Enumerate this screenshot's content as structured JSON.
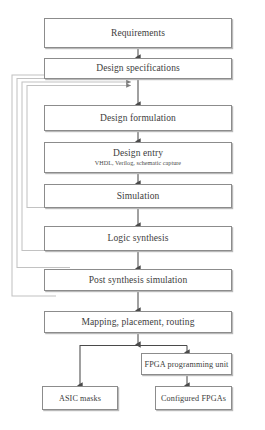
{
  "diagram": {
    "stroke_color": "#8c8c8c",
    "shadow_color": "#b9b9b9",
    "loop_color": "#c2c2c2",
    "text_color": "#3d3d3d",
    "background": "#ffffff"
  },
  "nodes": {
    "requirements": {
      "label": "Requirements"
    },
    "design_specifications": {
      "label": "Design specifications"
    },
    "design_formulation": {
      "label": "Design formulation"
    },
    "design_entry": {
      "label": "Design entry",
      "subtitle": "VHDL, Verilog, schematic capture"
    },
    "simulation": {
      "label": "Simulation"
    },
    "logic_synthesis": {
      "label": "Logic synthesis"
    },
    "post_synthesis_simulation": {
      "label": "Post synthesis simulation"
    },
    "mapping_placement_routing": {
      "label": "Mapping, placement, routing"
    },
    "fpga_programming_unit": {
      "label": "FPGA programming unit"
    },
    "asic_masks": {
      "label": "ASIC masks"
    },
    "configured_fpgas": {
      "label": "Configured FPGAs"
    }
  },
  "edges": [
    {
      "from": "requirements",
      "to": "design_specifications",
      "kind": "forward"
    },
    {
      "from": "design_specifications",
      "to": "design_formulation",
      "kind": "forward"
    },
    {
      "from": "design_formulation",
      "to": "design_entry",
      "kind": "forward"
    },
    {
      "from": "design_entry",
      "to": "simulation",
      "kind": "forward"
    },
    {
      "from": "simulation",
      "to": "logic_synthesis",
      "kind": "forward"
    },
    {
      "from": "logic_synthesis",
      "to": "post_synthesis_simulation",
      "kind": "forward"
    },
    {
      "from": "post_synthesis_simulation",
      "to": "mapping_placement_routing",
      "kind": "forward"
    },
    {
      "from": "mapping_placement_routing",
      "to": "asic_masks",
      "kind": "branch"
    },
    {
      "from": "mapping_placement_routing",
      "to": "fpga_programming_unit",
      "kind": "forward"
    },
    {
      "from": "fpga_programming_unit",
      "to": "configured_fpgas",
      "kind": "forward"
    },
    {
      "from": "design_formulation",
      "to": "design_specifications",
      "kind": "feedback"
    },
    {
      "from": "simulation",
      "to": "design_specifications",
      "kind": "feedback"
    },
    {
      "from": "logic_synthesis",
      "to": "design_specifications",
      "kind": "feedback"
    },
    {
      "from": "post_synthesis_simulation",
      "to": "design_specifications",
      "kind": "feedback"
    }
  ]
}
